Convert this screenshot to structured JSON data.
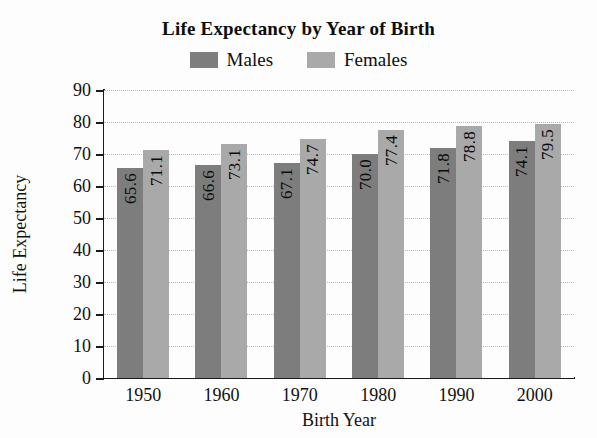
{
  "chart_data": {
    "type": "bar",
    "title": "Life Expectancy by Year of Birth",
    "xlabel": "Birth Year",
    "ylabel": "Life Expectancy",
    "categories": [
      "1950",
      "1960",
      "1970",
      "1980",
      "1990",
      "2000"
    ],
    "series": [
      {
        "name": "Males",
        "color": "#7d7d7d",
        "values": [
          65.6,
          66.6,
          67.1,
          70.0,
          71.8,
          74.1
        ],
        "labels": [
          "65.6",
          "66.6",
          "67.1",
          "70.0",
          "71.8",
          "74.1"
        ]
      },
      {
        "name": "Females",
        "color": "#a9a9a9",
        "values": [
          71.1,
          73.1,
          74.7,
          77.4,
          78.8,
          79.5
        ],
        "labels": [
          "71.1",
          "73.1",
          "74.7",
          "77.4",
          "78.8",
          "79.5"
        ]
      }
    ],
    "ylim": [
      0,
      90
    ],
    "ytick_step": 10,
    "yticks": [
      "0",
      "10",
      "20",
      "30",
      "40",
      "50",
      "60",
      "70",
      "80",
      "90"
    ],
    "grid": true,
    "grid_style": "dotted",
    "legend_position": "top-center",
    "bar_value_labels": "inside-top-rotated"
  }
}
